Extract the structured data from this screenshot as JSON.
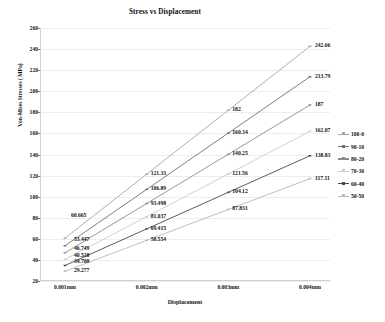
{
  "chart_data": {
    "type": "line",
    "title": "Stress vs Displacement",
    "xlabel": "Displacement",
    "ylabel": "Von-Mises Stresses ( MPa)",
    "categories": [
      "0.001mm",
      "0.002mm",
      "0.003mm",
      "0.004mm"
    ],
    "x_tick_labels": [
      "0.001mm",
      "0.002mm",
      "0.003mm",
      "0.004mm"
    ],
    "y_tick_labels": [
      "260",
      "240",
      "220",
      "200",
      "180",
      "160",
      "140",
      "120",
      "100",
      "80",
      "60",
      "40",
      "20"
    ],
    "ylim": [
      20,
      260
    ],
    "y_step": 20,
    "grid": "horizontal",
    "legend_position": "right",
    "series": [
      {
        "name": "100-0",
        "color": "#a6a6a6",
        "values": [
          60.665,
          121.33,
          182,
          242.66
        ],
        "labels": [
          "60.665",
          "121.33",
          "182",
          "242.66"
        ]
      },
      {
        "name": "90-10",
        "color": "#6f6f6f",
        "values": [
          53.447,
          106.89,
          160.34,
          213.79
        ],
        "labels": [
          "53.447",
          "106.89",
          "160.34",
          "213.79"
        ]
      },
      {
        "name": "80-20",
        "color": "#8a8a8a",
        "values": [
          46.749,
          93.498,
          140.25,
          187
        ],
        "labels": [
          "46.749",
          "93.498",
          "140.25",
          "187"
        ]
      },
      {
        "name": "70-30",
        "color": "#cccccc",
        "values": [
          40.518,
          81.037,
          121.56,
          162.07
        ],
        "labels": [
          "40.518",
          "81.037",
          "121.56",
          "162.07"
        ]
      },
      {
        "name": "60-40",
        "color": "#4a4a4a",
        "values": [
          34.708,
          69.415,
          104.12,
          138.83
        ],
        "labels": [
          "34.708",
          "69.415",
          "104.12",
          "138.83"
        ]
      },
      {
        "name": "50-50",
        "color": "#b8b8b8",
        "values": [
          29.277,
          58.554,
          87.831,
          117.11
        ],
        "labels": [
          "29.277",
          "58.554",
          "87.831",
          "117.11"
        ]
      }
    ]
  }
}
